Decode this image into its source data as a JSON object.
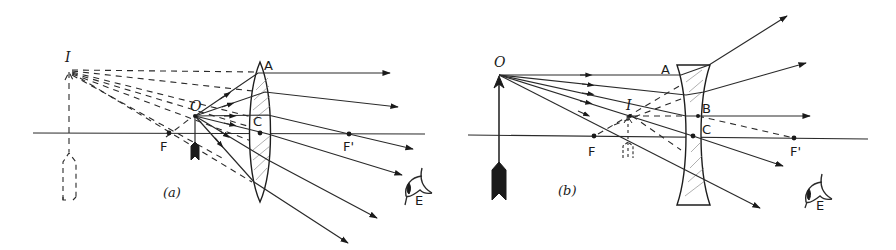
{
  "figure": {
    "panels": [
      {
        "id": "a",
        "caption": "(a)",
        "lens_type": "converging",
        "labels": {
          "image": "I",
          "object": "O",
          "lens_top": "A",
          "center": "C",
          "focus_left": "F",
          "focus_right": "F'",
          "eye": "E"
        }
      },
      {
        "id": "b",
        "caption": "(b)",
        "lens_type": "diverging",
        "labels": {
          "object": "O",
          "image": "I",
          "lens_top": "A",
          "ray_point": "B",
          "center": "C",
          "focus_left": "F",
          "focus_right": "F'",
          "eye": "E"
        }
      }
    ]
  },
  "colors": {
    "ink": "#1a1a1a",
    "background": "#ffffff",
    "hatch": "#7a7a7a"
  }
}
